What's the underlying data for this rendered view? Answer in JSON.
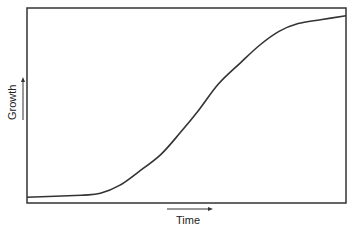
{
  "chart_data": {
    "type": "line",
    "title": "",
    "xlabel": "Time",
    "ylabel": "Growth",
    "grid": false,
    "legend": null,
    "x_ticks": [],
    "y_ticks": [],
    "xlim": [
      0,
      1
    ],
    "ylim": [
      0,
      1
    ],
    "series": [
      {
        "name": "Growth",
        "x": [
          0.0,
          0.17,
          0.23,
          0.29,
          0.35,
          0.42,
          0.48,
          0.54,
          0.6,
          0.67,
          0.73,
          0.79,
          0.85,
          0.92,
          1.0
        ],
        "values": [
          0.03,
          0.04,
          0.05,
          0.09,
          0.16,
          0.25,
          0.36,
          0.48,
          0.61,
          0.72,
          0.81,
          0.88,
          0.92,
          0.94,
          0.96
        ]
      }
    ],
    "colors": {
      "line": "#333333",
      "frame": "#333333"
    }
  }
}
